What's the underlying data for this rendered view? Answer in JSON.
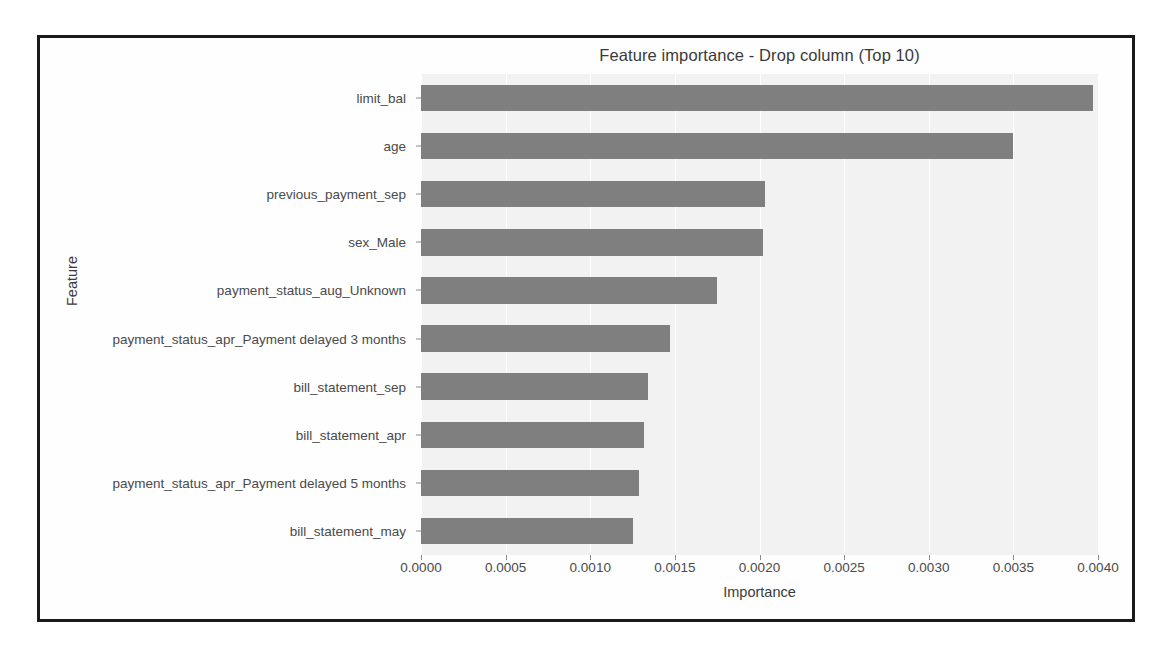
{
  "figure": {
    "border_color": "#1a1a1a",
    "axes_bg": "#f2f2f2",
    "bar_color": "#7f7f7f",
    "grid_color": "#ffffff"
  },
  "chart_data": {
    "type": "bar",
    "orientation": "horizontal",
    "title": "Feature importance - Drop column (Top 10)",
    "xlabel": "Importance",
    "ylabel": "Feature",
    "categories": [
      "limit_bal",
      "age",
      "previous_payment_sep",
      "sex_Male",
      "payment_status_aug_Unknown",
      "payment_status_apr_Payment delayed 3 months",
      "bill_statement_sep",
      "bill_statement_apr",
      "payment_status_apr_Payment delayed 5 months",
      "bill_statement_may"
    ],
    "values": [
      0.00397,
      0.0035,
      0.00203,
      0.00202,
      0.00175,
      0.00147,
      0.00134,
      0.00132,
      0.00129,
      0.00125
    ],
    "xlim": [
      0.0,
      0.004
    ],
    "xticks": [
      0.0,
      0.0005,
      0.001,
      0.0015,
      0.002,
      0.0025,
      0.003,
      0.0035,
      0.004
    ],
    "xtick_labels": [
      "0.0000",
      "0.0005",
      "0.0010",
      "0.0015",
      "0.0020",
      "0.0025",
      "0.0030",
      "0.0035",
      "0.0040"
    ],
    "grid": "vertical",
    "legend": null
  }
}
